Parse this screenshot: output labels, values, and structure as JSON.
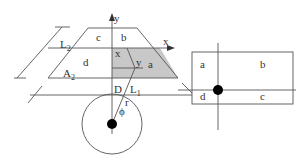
{
  "diagram": {
    "type": "geometry-figure",
    "colors": {
      "line": "#555555",
      "shade": "#c8c8c8",
      "dot": "#000000",
      "text": "#333333"
    },
    "left_figure": {
      "axes": {
        "x_label": "x",
        "y_label": "y"
      },
      "regions": {
        "a": "a",
        "b": "b",
        "c": "c",
        "d": "d"
      },
      "point_labels": {
        "x": "x",
        "y": "y",
        "D": "D"
      },
      "lines": {
        "L2_main": "L",
        "L2_sub": "2",
        "L1_main": "L",
        "L1_sub": "1"
      },
      "area": {
        "A2_main": "A",
        "A2_sub": "2"
      },
      "circle": {
        "r": "r",
        "phi": "ϕ"
      }
    },
    "right_figure": {
      "regions": {
        "a": "a",
        "b": "b",
        "c": "c",
        "d": "d"
      }
    }
  }
}
